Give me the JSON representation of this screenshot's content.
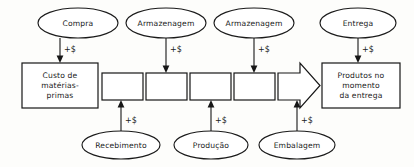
{
  "diagram": {
    "cost_marker": "+$",
    "colors": {
      "stroke": "#161616",
      "fill": "#ffffff",
      "background": "#fdfdfb"
    },
    "top_activities": [
      {
        "id": "compra",
        "label": "Compra",
        "cx": 78,
        "cy": 23,
        "rx": 40,
        "ry": 15,
        "target_x": 60,
        "cost_label": "+$"
      },
      {
        "id": "armazenagem-1",
        "label": "Armazenagem",
        "cx": 166,
        "cy": 23,
        "rx": 40,
        "ry": 15,
        "target_x": 166,
        "cost_label": "+$"
      },
      {
        "id": "armazenagem-2",
        "label": "Armazenagem",
        "cx": 254,
        "cy": 23,
        "rx": 40,
        "ry": 15,
        "target_x": 254,
        "cost_label": "+$"
      },
      {
        "id": "entrega",
        "label": "Entrega",
        "cx": 358,
        "cy": 23,
        "rx": 38,
        "ry": 15,
        "target_x": 358,
        "cost_label": "+$"
      }
    ],
    "bottom_activities": [
      {
        "id": "recebimento",
        "label": "Recebimento",
        "cx": 121,
        "cy": 145,
        "rx": 39,
        "ry": 14,
        "target_x": 121,
        "cost_label": "+$"
      },
      {
        "id": "producao",
        "label": "Produção",
        "cx": 211,
        "cy": 145,
        "rx": 37,
        "ry": 14,
        "target_x": 211,
        "cost_label": "+$"
      },
      {
        "id": "embalagem",
        "label": "Embalagem",
        "cx": 297,
        "cy": 145,
        "rx": 38,
        "ry": 14,
        "target_x": 297,
        "cost_label": "+$"
      }
    ],
    "start_box": {
      "id": "custo-materias-primas",
      "lines": [
        "Custo de",
        "matérias-",
        "primas"
      ],
      "x": 22,
      "y": 63,
      "width": 76,
      "height": 45
    },
    "end_box": {
      "id": "produtos-momento-entrega",
      "lines": [
        "Produtos no",
        "momento",
        "da entrega"
      ],
      "x": 322,
      "y": 63,
      "width": 78,
      "height": 45
    },
    "stage_boxes": [
      {
        "id": "stage-1",
        "label": "",
        "x": 102,
        "y": 73,
        "width": 41,
        "height": 27
      },
      {
        "id": "stage-2",
        "label": "",
        "x": 146,
        "y": 73,
        "width": 41,
        "height": 27
      },
      {
        "id": "stage-3",
        "label": "",
        "x": 190,
        "y": 73,
        "width": 41,
        "height": 27
      },
      {
        "id": "stage-4",
        "label": "",
        "x": 234,
        "y": 73,
        "width": 41,
        "height": 27
      }
    ],
    "flow_arrow": {
      "id": "flow-arrow",
      "x": 278,
      "y": 63,
      "width": 42,
      "height": 45
    }
  }
}
